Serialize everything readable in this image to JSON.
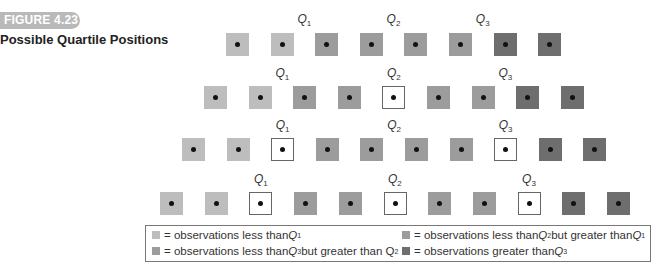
{
  "figure": {
    "number_label": "FIGURE 4.23",
    "title": "Possible Quartile Positions",
    "badge_color": "#b9b9b9"
  },
  "colors": {
    "light": "#bdbdbd",
    "medium": "#9c9c9c",
    "dark": "#6e6e6e",
    "white": "#ffffff"
  },
  "rows": [
    {
      "n": 8,
      "squares": [
        "light",
        "light",
        "medium",
        "medium",
        "medium",
        "medium",
        "dark",
        "dark"
      ],
      "quartiles": [
        {
          "label": "Q",
          "sub": "1",
          "position": "between 2 and 3"
        },
        {
          "label": "Q",
          "sub": "2",
          "position": "between 4 and 5"
        },
        {
          "label": "Q",
          "sub": "3",
          "position": "between 6 and 7"
        }
      ]
    },
    {
      "n": 9,
      "squares": [
        "light",
        "light",
        "medium",
        "medium",
        "white",
        "medium",
        "medium",
        "dark",
        "dark"
      ],
      "quartiles": [
        {
          "label": "Q",
          "sub": "1",
          "position": "between 2 and 3"
        },
        {
          "label": "Q",
          "sub": "2",
          "position": "at 5"
        },
        {
          "label": "Q",
          "sub": "3",
          "position": "between 7 and 8"
        }
      ]
    },
    {
      "n": 10,
      "squares": [
        "light",
        "light",
        "white",
        "medium",
        "medium",
        "medium",
        "medium",
        "white",
        "dark",
        "dark"
      ],
      "quartiles": [
        {
          "label": "Q",
          "sub": "1",
          "position": "at 3"
        },
        {
          "label": "Q",
          "sub": "2",
          "position": "between 5 and 6"
        },
        {
          "label": "Q",
          "sub": "3",
          "position": "at 8"
        }
      ]
    },
    {
      "n": 11,
      "squares": [
        "light",
        "light",
        "white",
        "medium",
        "medium",
        "white",
        "medium",
        "medium",
        "white",
        "dark",
        "dark"
      ],
      "quartiles": [
        {
          "label": "Q",
          "sub": "1",
          "position": "at 3"
        },
        {
          "label": "Q",
          "sub": "2",
          "position": "at 6"
        },
        {
          "label": "Q",
          "sub": "3",
          "position": "at 9"
        }
      ]
    }
  ],
  "legend": {
    "items": [
      {
        "swatch": "light",
        "prefix": "= observations less than ",
        "q1": "Q",
        "q1sub": "1",
        "mid": "",
        "q2": "",
        "q2sub": ""
      },
      {
        "swatch": "medium",
        "prefix": "= observations less than ",
        "q1": "Q",
        "q1sub": "2",
        "mid": " but greater than ",
        "q2": "Q",
        "q2sub": "1"
      },
      {
        "swatch": "medium",
        "prefix": "= observations less than ",
        "q1": "Q",
        "q1sub": "3",
        "mid": " but greater than Q",
        "q2": "",
        "q2sub": "2"
      },
      {
        "swatch": "dark",
        "prefix": "= observations greater than ",
        "q1": "Q",
        "q1sub": "3",
        "mid": "",
        "q2": "",
        "q2sub": ""
      }
    ]
  }
}
